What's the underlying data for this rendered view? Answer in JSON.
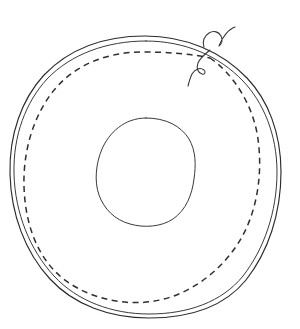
{
  "figure": {
    "background_color": "#ffffff",
    "line_color": "#2b2b2b",
    "dashed_line_color": "#2f2f2f",
    "filament_color": "#333333",
    "width": 300,
    "height": 329,
    "caption": "",
    "title": ""
  },
  "chart_data": {
    "type": "diagram",
    "title": "",
    "elements": [
      {
        "name": "outer-contour-primary",
        "shape": "ellipse",
        "style": "solid",
        "center": [
          145,
          177
        ],
        "rx": 135,
        "ry": 141,
        "bbox": [
          10,
          36,
          281,
          318
        ]
      },
      {
        "name": "outer-contour-secondary",
        "shape": "ellipse",
        "style": "solid",
        "center": [
          145,
          177
        ],
        "rx": 131,
        "ry": 137,
        "bbox": [
          14,
          40,
          277,
          314
        ]
      },
      {
        "name": "inner-dashed-contour",
        "shape": "ellipse",
        "style": "dashed",
        "dash_pattern": [
          6,
          4.5
        ],
        "center": [
          143,
          177
        ],
        "rx": 119,
        "ry": 125,
        "bbox": [
          24,
          52,
          262,
          302
        ]
      },
      {
        "name": "central-circle",
        "shape": "circle",
        "style": "solid",
        "center": [
          146,
          173
        ],
        "rx": 50,
        "ry": 55,
        "bbox": [
          96,
          118,
          195,
          227
        ]
      },
      {
        "name": "filament-upper",
        "shape": "wavy-line",
        "style": "solid",
        "start": [
          205,
          44
        ],
        "end": [
          232,
          27
        ]
      },
      {
        "name": "filament-lower",
        "shape": "wavy-line",
        "style": "solid",
        "start": [
          209,
          50
        ],
        "end": [
          189,
          85
        ]
      }
    ],
    "xlabel": "",
    "ylabel": "",
    "grid": false,
    "legend": []
  }
}
